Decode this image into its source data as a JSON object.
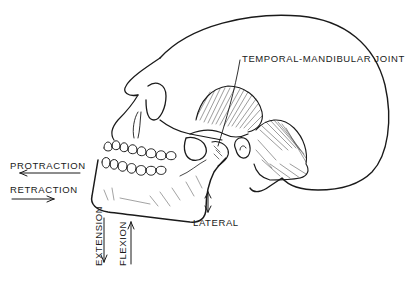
{
  "diagram": {
    "colors": {
      "ink": "#1a1a1a",
      "background": "#ffffff"
    },
    "labels": {
      "tmj": "TEMPORAL-MANDIBULAR JOINT",
      "protraction": "PROTRACTION",
      "retraction": "RETRACTION",
      "extension": "EXTENSION",
      "flexion": "FLEXION",
      "lateral": "LATERAL"
    },
    "arrows": {
      "protraction": "left",
      "retraction": "right",
      "extension": "down",
      "flexion": "up",
      "lateral": "up-down"
    }
  }
}
